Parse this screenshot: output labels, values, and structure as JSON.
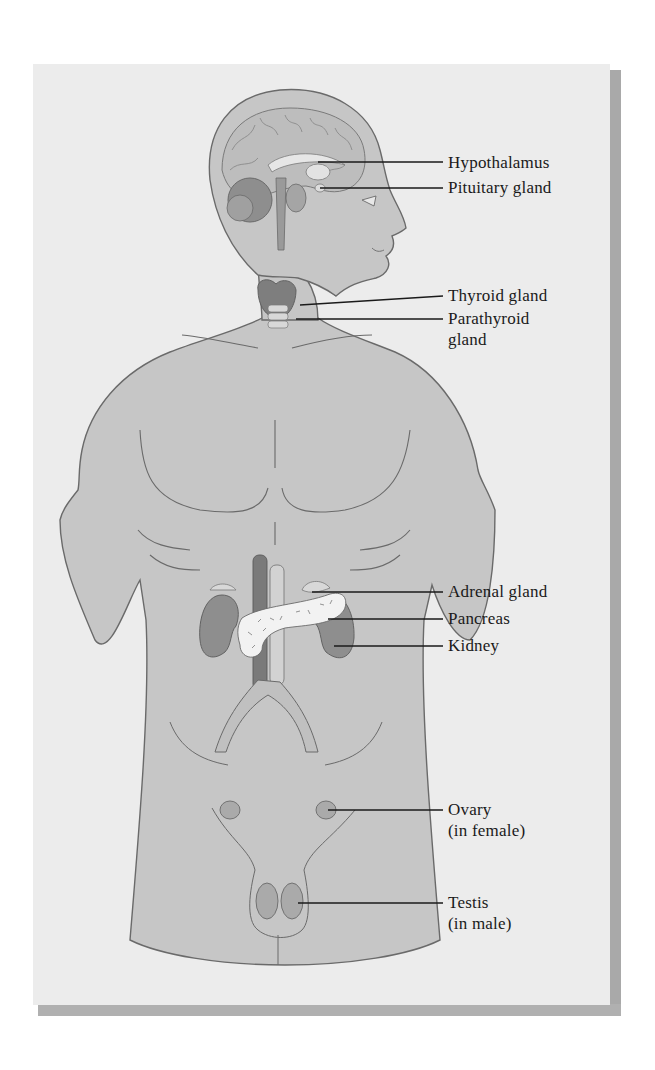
{
  "figure": {
    "colors": {
      "card_background": "#ececec",
      "body_fill": "#c6c6c6",
      "outline": "#6a6a6a",
      "organ_dark": "#8e8e8e",
      "organ_mid": "#a9a9a9",
      "leader_line": "#1a1a1a",
      "shadow": "#a9a9a9"
    },
    "labels": [
      {
        "id": "hypothalamus",
        "line1": "Hypothalamus",
        "line2": ""
      },
      {
        "id": "pituitary",
        "line1": "Pituitary gland",
        "line2": ""
      },
      {
        "id": "thyroid",
        "line1": "Thyroid gland",
        "line2": ""
      },
      {
        "id": "parathyroid",
        "line1": "Parathyroid",
        "line2": "gland"
      },
      {
        "id": "adrenal",
        "line1": "Adrenal gland",
        "line2": ""
      },
      {
        "id": "pancreas",
        "line1": "Pancreas",
        "line2": ""
      },
      {
        "id": "kidney",
        "line1": "Kidney",
        "line2": ""
      },
      {
        "id": "ovary",
        "line1": "Ovary",
        "line2": "(in female)"
      },
      {
        "id": "testis",
        "line1": "Testis",
        "line2": "(in male)"
      }
    ]
  }
}
